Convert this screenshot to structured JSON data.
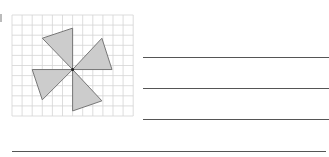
{
  "worksheet": {
    "question_number_visible": "",
    "figure": {
      "description": "pinwheel of four grey triangles on square grid",
      "grid": {
        "columns": 12,
        "rows": 10,
        "line_color": "#d4d4d4"
      },
      "shape_fill": "#cccccc",
      "shape_stroke": "#777777",
      "triangles": [
        {
          "name": "top",
          "points_grid": [
            [
              6,
              5.4
            ],
            [
              6,
              1.3
            ],
            [
              3,
              2.3
            ]
          ]
        },
        {
          "name": "right",
          "points_grid": [
            [
              6,
              5.4
            ],
            [
              8.9,
              2.3
            ],
            [
              9.9,
              5.4
            ]
          ]
        },
        {
          "name": "left",
          "points_grid": [
            [
              6,
              5.4
            ],
            [
              2,
              5.4
            ],
            [
              3,
              8.4
            ]
          ]
        },
        {
          "name": "bottom",
          "points_grid": [
            [
              6,
              5.4
            ],
            [
              6,
              9.5
            ],
            [
              8.9,
              8.5
            ]
          ]
        }
      ],
      "center_point": [
        6,
        5.4
      ]
    },
    "answer_lines": {
      "count": 4,
      "color": "#555555"
    }
  }
}
